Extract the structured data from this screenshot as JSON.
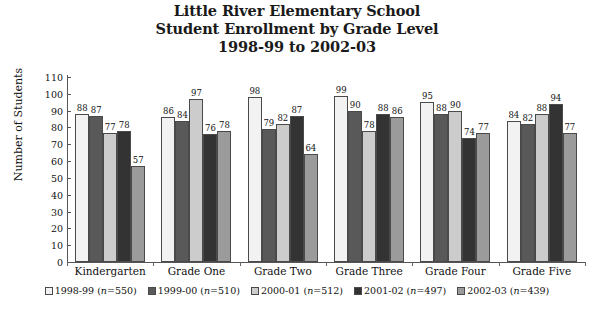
{
  "title": {
    "line1": "Little River Elementary School",
    "line2": "Student Enrollment by Grade Level",
    "line3": "1998-99 to 2002-03"
  },
  "chart_data": {
    "type": "bar",
    "title": "Little River Elementary School Student Enrollment by Grade Level 1998-99 to 2002-03",
    "xlabel": "",
    "ylabel": "Number of Students",
    "ylim": [
      0,
      110
    ],
    "ytick_step": 10,
    "yticks": [
      0,
      10,
      20,
      30,
      40,
      50,
      60,
      70,
      80,
      90,
      100,
      110
    ],
    "grid": false,
    "legend_position": "bottom",
    "categories": [
      "Kindergarten",
      "Grade One",
      "Grade Two",
      "Grade Three",
      "Grade Four",
      "Grade Five"
    ],
    "series": [
      {
        "name": "1998-99",
        "n": 550,
        "legend_label": "1998-99 (n=550)",
        "color": "#f2f2f2",
        "values": [
          88,
          86,
          98,
          99,
          95,
          84
        ]
      },
      {
        "name": "1999-00",
        "n": 510,
        "legend_label": "1999-00 (n=510)",
        "color": "#595959",
        "values": [
          87,
          84,
          79,
          90,
          88,
          82
        ]
      },
      {
        "name": "2000-01",
        "n": 512,
        "legend_label": "2000-01 (n=512)",
        "color": "#cccccc",
        "values": [
          77,
          97,
          82,
          78,
          90,
          88
        ]
      },
      {
        "name": "2001-02",
        "n": 497,
        "legend_label": "2001-02 (n=497)",
        "color": "#333333",
        "values": [
          78,
          76,
          87,
          88,
          74,
          94
        ]
      },
      {
        "name": "2002-03",
        "n": 439,
        "legend_label": "2002-03 (n=439)",
        "color": "#9b9b9b",
        "values": [
          57,
          78,
          64,
          86,
          77,
          77
        ]
      }
    ]
  }
}
